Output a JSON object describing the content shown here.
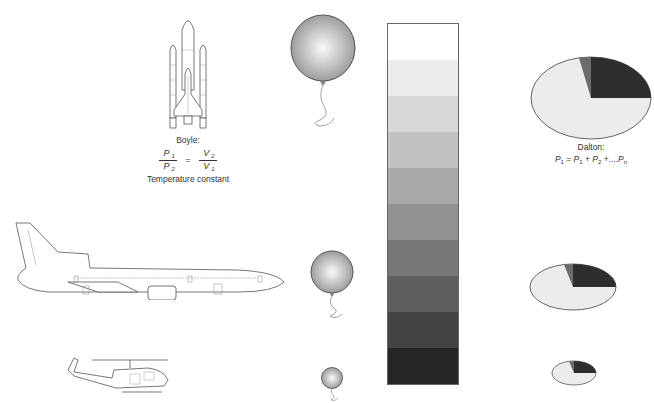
{
  "figure": {
    "boyle": {
      "title": "Boyle:",
      "p1": "P",
      "p1_sub": "1",
      "p2": "P",
      "p2_sub": "2",
      "v2": "V",
      "v2_sub": "2",
      "v1": "V",
      "v1_sub": "1",
      "equals": "=",
      "condition": "Temperature constant"
    },
    "dalton": {
      "title": "Dalton:",
      "formula_parts": [
        "P",
        "1",
        " = ",
        "P",
        "1",
        " + ",
        "P",
        "2",
        " +....",
        "P",
        "n"
      ]
    },
    "altitude_levels": [
      {
        "name": "space",
        "vehicle": "space-shuttle",
        "balloon_diameter": 64,
        "pie_scale": 1.0
      },
      {
        "name": "airliner-altitude",
        "vehicle": "airliner",
        "balloon_diameter": 42,
        "pie_scale": 0.61
      },
      {
        "name": "helicopter-altitude",
        "vehicle": "helicopter",
        "balloon_diameter": 22,
        "pie_scale": 0.33
      }
    ],
    "gradient_bands": [
      "#ffffff",
      "#ececec",
      "#d8d8d8",
      "#c2c2c2",
      "#a9a9a9",
      "#919191",
      "#777777",
      "#5e5e5e",
      "#434343",
      "#262626"
    ],
    "pie": {
      "light_color": "#ececec",
      "dark_color": "#2e2e2e",
      "mid_color": "#6b6b6b",
      "outline_color": "#555555"
    }
  }
}
